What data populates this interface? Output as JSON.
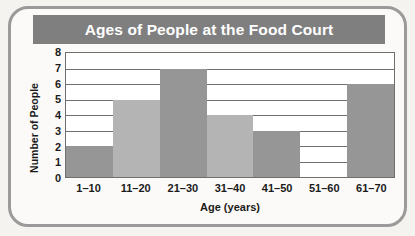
{
  "chart_data": {
    "type": "bar",
    "title": "Ages of People at the Food Court",
    "xlabel": "Age (years)",
    "ylabel": "Number of People",
    "categories": [
      "1–10",
      "11–20",
      "21–30",
      "31–40",
      "41–50",
      "51–60",
      "61–70"
    ],
    "values": [
      2,
      5,
      7,
      4,
      3,
      0,
      6
    ],
    "ylim": [
      0,
      8
    ],
    "yticks": [
      0,
      1,
      2,
      3,
      4,
      5,
      6,
      7,
      8
    ],
    "grid": true,
    "legend": null,
    "bar_shades": [
      "dark",
      "light",
      "dark",
      "light",
      "dark",
      "light",
      "dark"
    ],
    "colors": {
      "bar_dark": "#969696",
      "bar_light": "#b4b4b4",
      "title_banner": "#7f7f7f",
      "title_text": "#ffffff",
      "plot_background": "#ffffff",
      "axis_line": "#6f6f6f",
      "gridline": "#707070",
      "page_background": "#f4f3f0",
      "frame_border": "#9a9a9a",
      "text": "#1b1b1b"
    }
  }
}
